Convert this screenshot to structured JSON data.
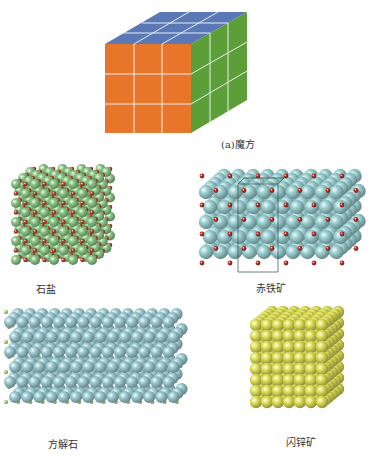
{
  "figure": {
    "panels": [
      {
        "id": "rubiks-cube",
        "label": "(a)魔方",
        "colors": {
          "top": "#5b78b6",
          "front": "#e8762a",
          "side": "#5c9e37",
          "grid": "#e8eef2"
        }
      },
      {
        "id": "rock-salt",
        "label": "石盐",
        "colors": {
          "large": "#8ecb8a",
          "small": "#b8432c"
        }
      },
      {
        "id": "hematite",
        "label": "赤铁矿",
        "colors": {
          "large": "#9fd4d6",
          "small": "#b5342a"
        }
      },
      {
        "id": "calcite",
        "label": "方解石",
        "colors": {
          "large": "#9fcfd6",
          "small": "#a8cc7a"
        }
      },
      {
        "id": "sphalerite",
        "label": "闪锌矿",
        "colors": {
          "large": "#e2e35a"
        }
      }
    ]
  }
}
